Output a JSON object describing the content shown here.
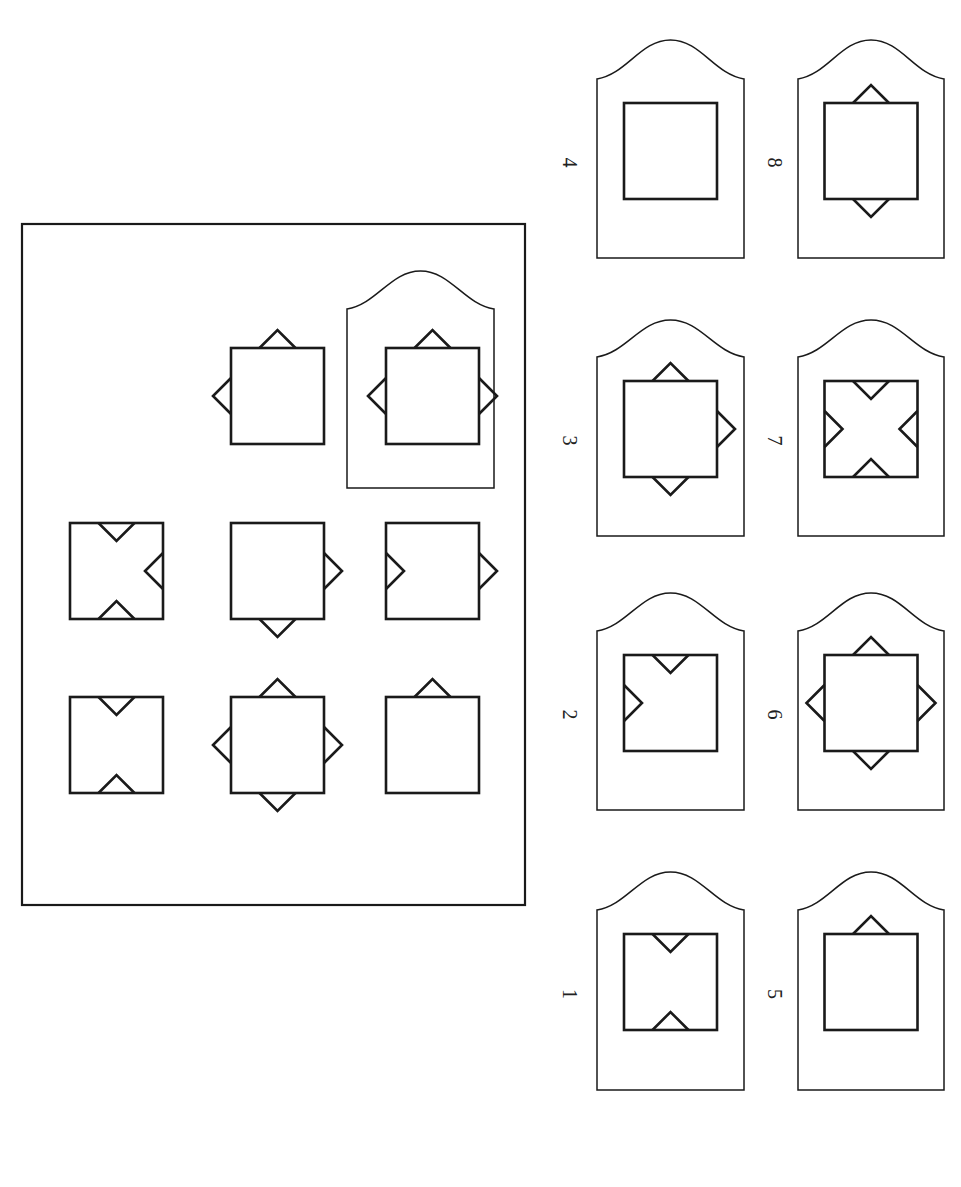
{
  "puzzle": {
    "orientation": "rotated-90-clockwise",
    "stroke_color": "#1a1a1a",
    "background": "#ffffff",
    "grid": {
      "rows": 3,
      "cols": 3,
      "cells": [
        {
          "row": 0,
          "col": 0,
          "square": true,
          "outer": [
            "left"
          ],
          "inner": []
        },
        {
          "row": 0,
          "col": 1,
          "square": true,
          "outer": [
            "top"
          ],
          "inner": [
            "bottom"
          ]
        },
        {
          "row": 0,
          "col": 2,
          "square": true,
          "outer": [
            "top",
            "left",
            "bottom"
          ],
          "inner": []
        },
        {
          "row": 1,
          "col": 0,
          "square": true,
          "outer": [
            "top",
            "right",
            "bottom",
            "left"
          ],
          "inner": []
        },
        {
          "row": 1,
          "col": 1,
          "square": true,
          "outer": [
            "top",
            "right"
          ],
          "inner": []
        },
        {
          "row": 1,
          "col": 2,
          "square": true,
          "outer": [
            "left",
            "bottom"
          ],
          "inner": []
        },
        {
          "row": 2,
          "col": 0,
          "square": true,
          "outer": [],
          "inner": [
            "left",
            "right"
          ]
        },
        {
          "row": 2,
          "col": 1,
          "square": true,
          "outer": [],
          "inner": [
            "top",
            "left",
            "right"
          ]
        },
        {
          "row": 2,
          "col": 2,
          "square": false,
          "placeholder": "missing-piece-frame"
        }
      ]
    },
    "options": [
      {
        "label": "1",
        "outer": [],
        "inner": [
          "top",
          "bottom"
        ]
      },
      {
        "label": "2",
        "outer": [],
        "inner": [
          "top",
          "left"
        ]
      },
      {
        "label": "3",
        "outer": [
          "top",
          "right",
          "bottom"
        ],
        "inner": []
      },
      {
        "label": "4",
        "outer": [],
        "inner": []
      },
      {
        "label": "5",
        "outer": [
          "top"
        ],
        "inner": []
      },
      {
        "label": "6",
        "outer": [
          "top",
          "right",
          "bottom",
          "left"
        ],
        "inner": []
      },
      {
        "label": "7",
        "outer": [],
        "inner": [
          "top",
          "right",
          "bottom",
          "left"
        ]
      },
      {
        "label": "8",
        "outer": [
          "top",
          "bottom"
        ],
        "inner": []
      }
    ]
  }
}
